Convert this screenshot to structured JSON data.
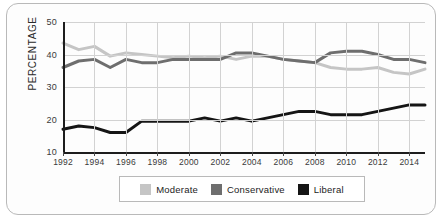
{
  "chart_data": {
    "type": "line",
    "title": "",
    "xlabel": "",
    "ylabel": "PERCENTAGE",
    "xlim": [
      1992,
      2015
    ],
    "ylim": [
      10,
      50
    ],
    "grid": true,
    "legend_position": "bottom",
    "x": [
      1992,
      1993,
      1994,
      1995,
      1996,
      1997,
      1998,
      1999,
      2000,
      2001,
      2002,
      2003,
      2004,
      2005,
      2006,
      2007,
      2008,
      2009,
      2010,
      2011,
      2012,
      2013,
      2014,
      2015
    ],
    "x_tick_labels": [
      "1992",
      "1994",
      "1996",
      "1998",
      "2000",
      "2002",
      "2004",
      "2006",
      "2008",
      "2010",
      "2012",
      "2014"
    ],
    "x_ticks": [
      1992,
      1994,
      1996,
      1998,
      2000,
      2002,
      2004,
      2006,
      2008,
      2010,
      2012,
      2014
    ],
    "y_tick_labels": [
      "10",
      "20",
      "30",
      "40",
      "50"
    ],
    "y_ticks": [
      10,
      20,
      30,
      40,
      50
    ],
    "series": [
      {
        "name": "Moderate",
        "color": "#c5c5c5",
        "values": [
          43.5,
          41.5,
          42.5,
          39.5,
          40.5,
          40.0,
          39.5,
          39.0,
          39.5,
          39.0,
          39.5,
          38.5,
          39.5,
          39.5,
          38.5,
          38.0,
          37.5,
          36.0,
          35.5,
          35.5,
          36.0,
          34.5,
          34.0,
          35.5
        ]
      },
      {
        "name": "Conservative",
        "color": "#6e6e6e",
        "values": [
          36.0,
          38.0,
          38.5,
          36.0,
          38.5,
          37.5,
          37.5,
          38.5,
          38.5,
          38.5,
          38.5,
          40.5,
          40.5,
          39.5,
          38.5,
          38.0,
          37.5,
          40.5,
          41.0,
          41.0,
          40.0,
          38.5,
          38.5,
          37.5
        ]
      },
      {
        "name": "Liberal",
        "color": "#151515",
        "values": [
          17.0,
          18.0,
          17.5,
          16.0,
          16.0,
          19.5,
          19.5,
          19.5,
          19.5,
          20.5,
          19.5,
          20.5,
          19.5,
          20.5,
          21.5,
          22.5,
          22.5,
          21.5,
          21.5,
          21.5,
          22.5,
          23.5,
          24.5,
          24.5
        ]
      }
    ]
  },
  "legend": {
    "items": [
      {
        "label": "Moderate",
        "color": "#c5c5c5"
      },
      {
        "label": "Conservative",
        "color": "#6e6e6e"
      },
      {
        "label": "Liberal",
        "color": "#151515"
      }
    ]
  }
}
